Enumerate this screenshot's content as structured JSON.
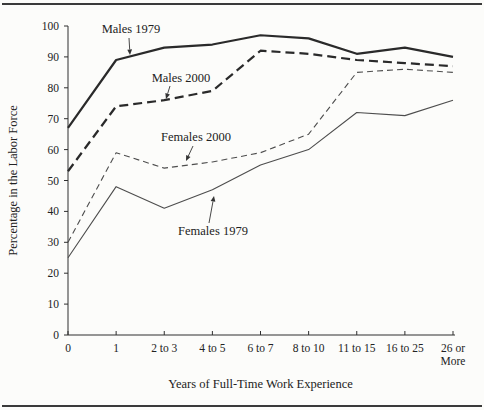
{
  "figure": {
    "background": "#fcfcfa",
    "rule_color": "#3a3a3a",
    "axis_color": "#2f2f2f",
    "text_color": "#222222"
  },
  "chart_data": {
    "type": "line",
    "title": "",
    "xlabel": "Years of Full-Time Work Experience",
    "ylabel": "Percentage in the Labor Force",
    "categories": [
      "0",
      "1",
      "2 to 3",
      "4 to 5",
      "6 to 7",
      "8 to 10",
      "11 to 15",
      "16 to 25",
      "26 or More"
    ],
    "ylim": [
      0,
      100
    ],
    "ytick_step": 10,
    "grid": false,
    "legend_position": "inline-annotations",
    "series": [
      {
        "name": "Males 1979",
        "values": [
          67,
          89,
          93,
          94,
          97,
          96,
          91,
          93,
          90
        ],
        "style": {
          "color": "#2a2a2a",
          "width": 2.2,
          "dash": ""
        }
      },
      {
        "name": "Males 2000",
        "values": [
          53,
          74,
          76,
          79,
          92,
          91,
          89,
          88,
          87
        ],
        "style": {
          "color": "#2a2a2a",
          "width": 2.2,
          "dash": "9,5"
        }
      },
      {
        "name": "Females 2000",
        "values": [
          30,
          59,
          54,
          56,
          59,
          65,
          85,
          86,
          85
        ],
        "style": {
          "color": "#4d4d4d",
          "width": 1.1,
          "dash": "6,4"
        }
      },
      {
        "name": "Females 1979",
        "values": [
          25,
          48,
          41,
          47,
          55,
          60,
          72,
          71,
          76
        ],
        "style": {
          "color": "#4d4d4d",
          "width": 1.1,
          "dash": ""
        }
      }
    ],
    "annotations": [
      {
        "text": "Males 1979",
        "tx": 131,
        "ty": 33,
        "ax1": 129,
        "ay1": 38,
        "ax2": 130,
        "ay2": 55
      },
      {
        "text": "Males 2000",
        "tx": 181,
        "ty": 82,
        "ax1": 170,
        "ay1": 86,
        "ax2": 166,
        "ay2": 99
      },
      {
        "text": "Females 2000",
        "tx": 196,
        "ty": 141,
        "ax1": 193,
        "ay1": 146,
        "ax2": 186,
        "ay2": 161
      },
      {
        "text": "Females 1979",
        "tx": 213,
        "ty": 235,
        "ax1": 209,
        "ay1": 223,
        "ax2": 214,
        "ay2": 196
      }
    ]
  }
}
